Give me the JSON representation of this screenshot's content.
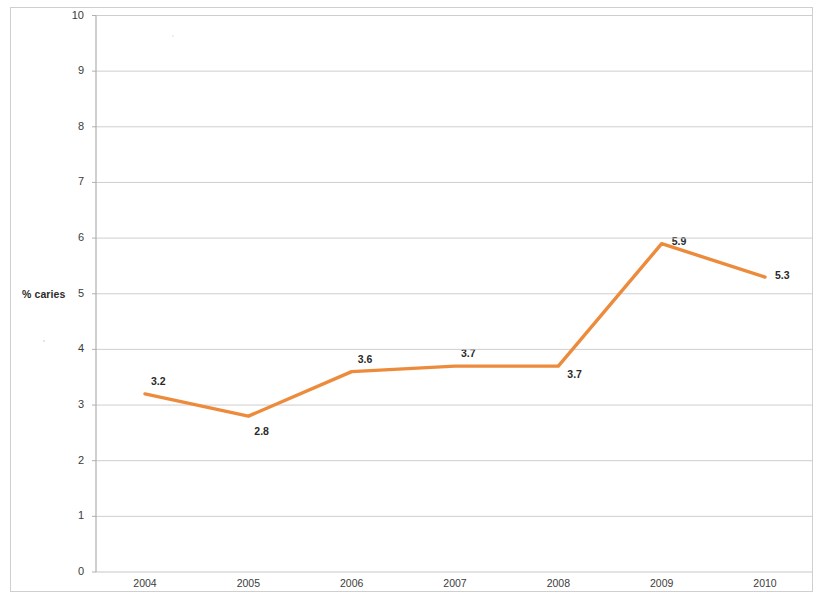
{
  "chart_data": {
    "type": "line",
    "title": "",
    "xlabel": "",
    "ylabel": "% caries",
    "categories": [
      "2004",
      "2005",
      "2006",
      "2007",
      "2008",
      "2009",
      "2010"
    ],
    "x": [
      2004,
      2005,
      2006,
      2007,
      2008,
      2009,
      2010
    ],
    "values": [
      3.2,
      2.8,
      3.6,
      3.7,
      3.7,
      5.9,
      5.3
    ],
    "data_labels": [
      "3.2",
      "2.8",
      "3.6",
      "3.7",
      "3.7",
      "5.9",
      "5.3"
    ],
    "ylim": [
      0,
      10
    ],
    "ytick_labels": [
      "10",
      "9",
      "8",
      "7",
      "6",
      "5",
      "4",
      "3",
      "2",
      "1",
      "0"
    ],
    "ytick_values": [
      10,
      9,
      8,
      7,
      6,
      5,
      4,
      3,
      2,
      1,
      0
    ],
    "grid": true,
    "grid_axis": "y",
    "legend": false,
    "legend_position": "none",
    "series": [
      {
        "name": "% caries",
        "color": "#ED8B3C",
        "values": [
          3.2,
          2.8,
          3.6,
          3.7,
          3.7,
          5.9,
          5.3
        ]
      }
    ],
    "colors": {
      "line": "#ED8B3C",
      "grid": "#c8c8c8",
      "axis": "#a8a8a8",
      "text": "#2b2b2b",
      "background": "#ffffff"
    }
  },
  "axis": {
    "y_title": "% caries"
  }
}
